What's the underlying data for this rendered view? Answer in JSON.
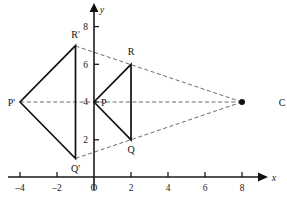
{
  "figure": {
    "axes": {
      "x_label": "x",
      "y_label": "y",
      "origin_label": "O",
      "x_ticks": [
        {
          "value": -4,
          "label": "–4"
        },
        {
          "value": -2,
          "label": "–2"
        },
        {
          "value": 2,
          "label": "2"
        },
        {
          "value": 4,
          "label": "4"
        },
        {
          "value": 6,
          "label": "6"
        },
        {
          "value": 8,
          "label": "8"
        }
      ],
      "y_ticks": [
        {
          "value": 2,
          "label": "2"
        },
        {
          "value": 4,
          "label": "4"
        },
        {
          "value": 6,
          "label": "6"
        },
        {
          "value": 8,
          "label": "8"
        }
      ],
      "x_range": [
        -5,
        9.3
      ],
      "y_range": [
        0,
        8.9
      ]
    },
    "points": {
      "P": {
        "label": "P",
        "x": 0,
        "y": 4
      },
      "Q": {
        "label": "Q",
        "x": 2,
        "y": 2
      },
      "R": {
        "label": "R",
        "x": 2,
        "y": 6
      },
      "Pprime": {
        "label": "P'",
        "x": -4,
        "y": 4
      },
      "Qprime": {
        "label": "Q'",
        "x": -1,
        "y": 1
      },
      "Rprime": {
        "label": "R'",
        "x": -1,
        "y": 7
      },
      "C": {
        "label": "C",
        "x": 8,
        "y": 4
      }
    },
    "triangles": [
      {
        "name": "triangle-pqr",
        "vertices": [
          "P",
          "Q",
          "R"
        ],
        "style": "solid"
      },
      {
        "name": "triangle-p-q-r-prime",
        "vertices": [
          "Pprime",
          "Qprime",
          "Rprime"
        ],
        "style": "solid"
      }
    ],
    "dashed_rays": [
      {
        "name": "ray-c-through-r",
        "from": "C",
        "to": "Rprime"
      },
      {
        "name": "ray-c-through-p",
        "from": "C",
        "to": "Pprime"
      },
      {
        "name": "ray-c-through-q",
        "from": "C",
        "to": "Qprime"
      }
    ],
    "colors": {
      "axis": "#1a1a1a",
      "solid_edge": "#111111",
      "dashed_ray": "#5a5a5a",
      "background": "#ffffff"
    }
  }
}
